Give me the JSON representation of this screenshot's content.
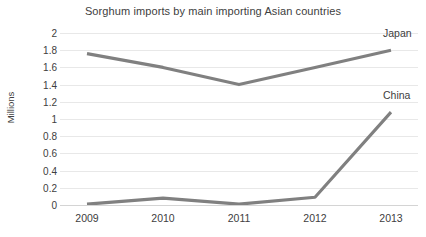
{
  "chart_data": {
    "type": "line",
    "title": "Sorghum imports by main importing Asian countries",
    "xlabel": "",
    "ylabel": "Millions",
    "categories": [
      "2009",
      "2010",
      "2011",
      "2012",
      "2013"
    ],
    "x": [
      2009,
      2010,
      2011,
      2012,
      2013
    ],
    "series": [
      {
        "name": "Japan",
        "values": [
          1.76,
          1.6,
          1.4,
          1.6,
          1.8
        ],
        "color": "#808080"
      },
      {
        "name": "China",
        "values": [
          0.01,
          0.08,
          0.01,
          0.09,
          1.08
        ],
        "color": "#808080"
      }
    ],
    "ylim": [
      0,
      2
    ],
    "yticks": [
      "0",
      "0.2",
      "0.4",
      "0.6",
      "0.8",
      "1",
      "1.2",
      "1.4",
      "1.6",
      "1.8",
      "2"
    ],
    "ytick_values": [
      0,
      0.2,
      0.4,
      0.6,
      0.8,
      1,
      1.2,
      1.4,
      1.6,
      1.8,
      2
    ],
    "grid": true,
    "grid_color": "#e8e8e8",
    "legend": "series-end-labels",
    "legend_position": "right",
    "background": "#ffffff",
    "text_color": "#404040"
  }
}
